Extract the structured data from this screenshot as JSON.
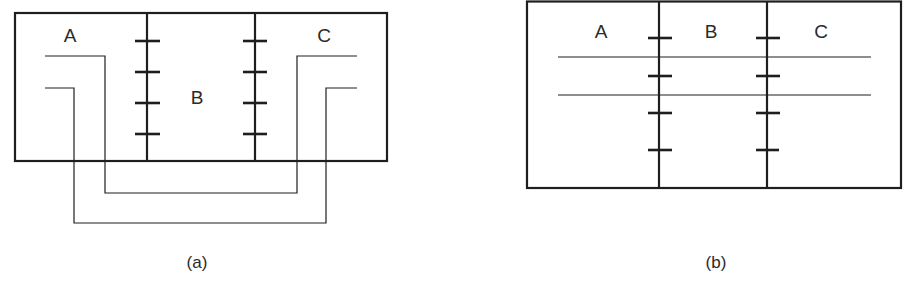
{
  "figure": {
    "panels": [
      {
        "id": "a",
        "caption": "(a)",
        "regions": [
          "A",
          "B",
          "C"
        ],
        "description": "Three-region box with two tick-marked boundaries; two U-shaped wires run from region A out under the box and back into region C"
      },
      {
        "id": "b",
        "caption": "(b)",
        "regions": [
          "A",
          "B",
          "C"
        ],
        "description": "Three-region box with two tick-marked boundaries; two straight horizontal lines cross all three regions"
      }
    ]
  },
  "colors": {
    "line": "#1e1e1e",
    "text": "#2a2a2a",
    "background": "#ffffff"
  }
}
